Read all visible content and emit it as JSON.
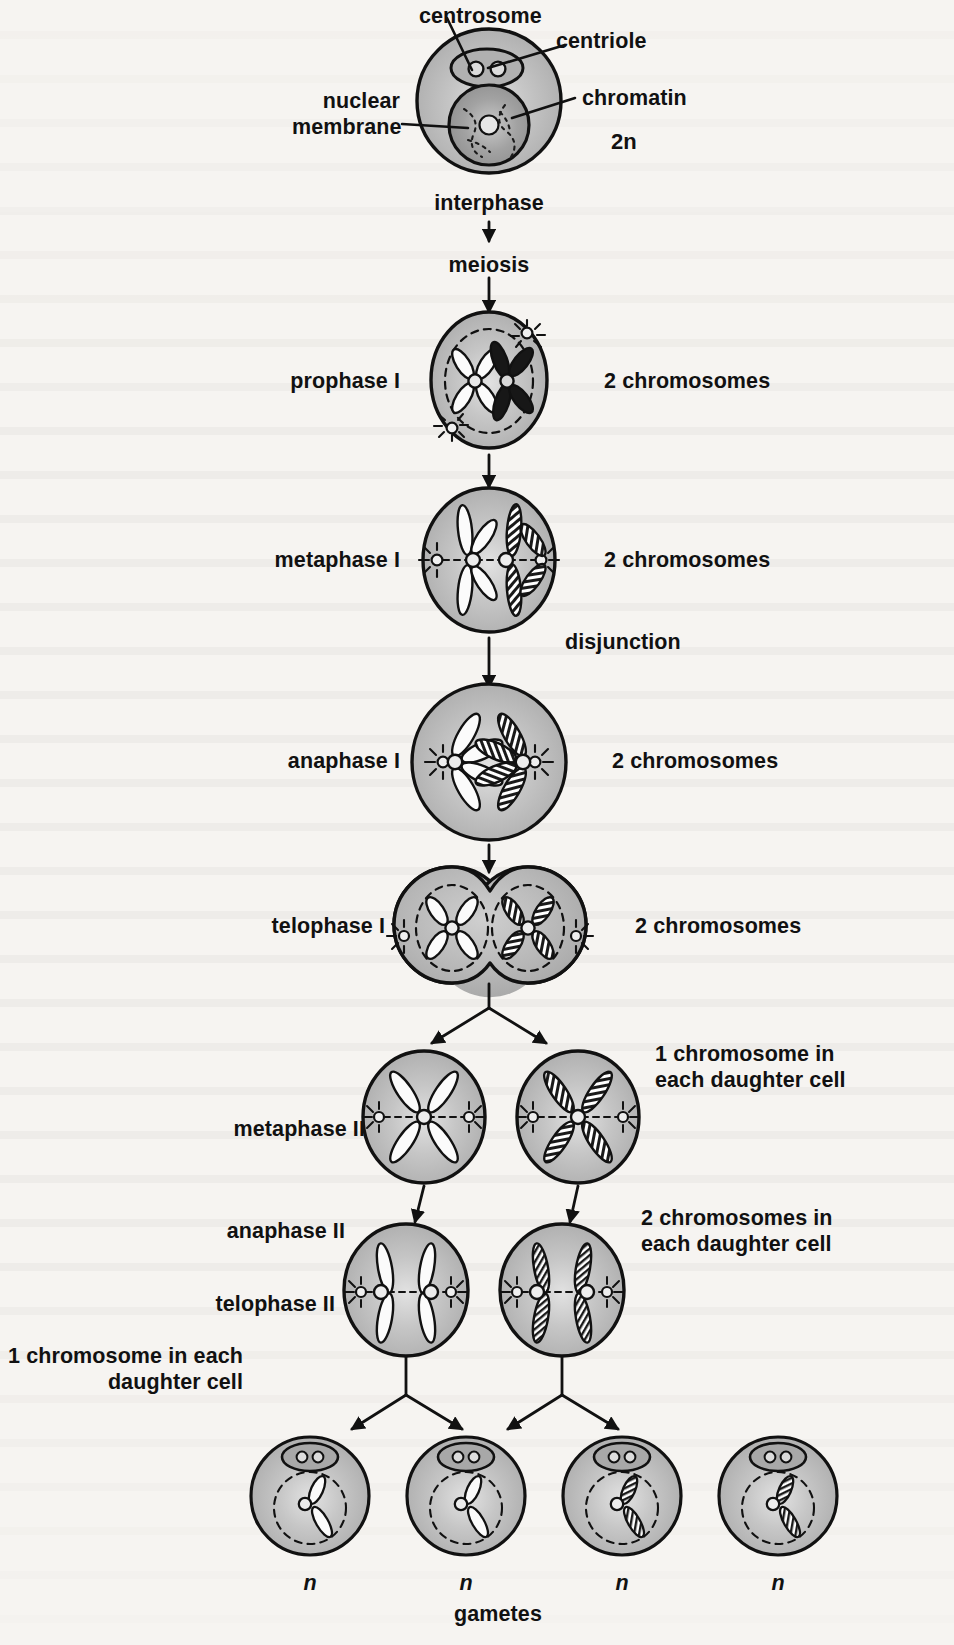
{
  "figure": {
    "subject": "meiosis",
    "background_color": "#f6f4f1",
    "cell_fill_color": "#b4b4b4",
    "cell_outline_color": "#111111",
    "nucleus_fill_color": "#9a9a9a"
  },
  "callouts": [
    {
      "id": "centrosome",
      "text": "centrosome"
    },
    {
      "id": "centriole",
      "text": "centriole"
    },
    {
      "id": "nuclear-membrane",
      "text": "nuclear\nmembrane"
    },
    {
      "id": "chromatin",
      "text": "chromatin"
    }
  ],
  "ploidy": {
    "diploid": "2n",
    "haploid": "n"
  },
  "flow": {
    "interphase_label": "interphase",
    "meiosis_label": "meiosis",
    "disjunction_label": "disjunction",
    "gametes_label": "gametes"
  },
  "stages": [
    {
      "id": "interphase",
      "name": "interphase",
      "stage_label": "",
      "count_label": "",
      "ploidy": "2n",
      "cells": 1,
      "chromosome_state": "chromatin"
    },
    {
      "id": "prophase-1",
      "name": "prophase I",
      "stage_label": "prophase I",
      "count_label": "2 chromosomes",
      "cells": 1,
      "chromosome_state": "condensed-pair-in-nucleus"
    },
    {
      "id": "metaphase-1",
      "name": "metaphase I",
      "stage_label": "metaphase I",
      "count_label": "2 chromosomes",
      "cells": 1,
      "chromosome_state": "aligned-at-equator"
    },
    {
      "id": "anaphase-1",
      "name": "anaphase I",
      "stage_label": "anaphase I",
      "count_label": "2 chromosomes",
      "cells": 1,
      "chromosome_state": "homologues-separating"
    },
    {
      "id": "telophase-1",
      "name": "telophase I",
      "stage_label": "telophase I",
      "count_label": "2 chromosomes",
      "cells": 2,
      "chromosome_state": "two-nuclei-reforming"
    },
    {
      "id": "metaphase-2",
      "name": "metaphase II",
      "stage_label": "metaphase II",
      "count_label": "1 chromosome in\neach daughter cell",
      "cells": 2,
      "chromosome_state": "aligned-at-equator"
    },
    {
      "id": "anaphase-2",
      "name": "anaphase II",
      "stage_label": "anaphase II",
      "count_label": "2 chromosomes in\neach daughter cell",
      "cells": 2,
      "chromosome_state": "chromatids-separating"
    },
    {
      "id": "telophase-2",
      "name": "telophase II",
      "stage_label": "telophase II",
      "count_label": "1 chromosome in each\ndaughter cell",
      "cells": 4,
      "chromosome_state": "single-chromosome-per-gamete"
    }
  ],
  "gametes": [
    {
      "id": "gamete-1",
      "ploidy": "n",
      "chromosome_style": "white"
    },
    {
      "id": "gamete-2",
      "ploidy": "n",
      "chromosome_style": "white"
    },
    {
      "id": "gamete-3",
      "ploidy": "n",
      "chromosome_style": "hatched"
    },
    {
      "id": "gamete-4",
      "ploidy": "n",
      "chromosome_style": "hatched"
    }
  ]
}
